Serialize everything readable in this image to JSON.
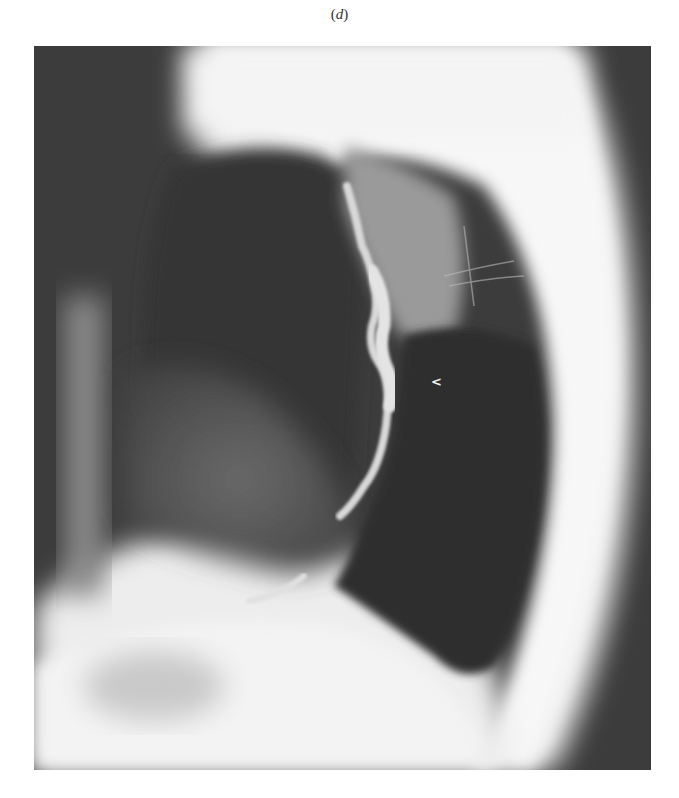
{
  "figure": {
    "panel_label_open": "(",
    "panel_label_letter": "d",
    "panel_label_close": ")",
    "image_type": "radiograph",
    "annotation_marker": "<",
    "colors": {
      "background": "#ffffff",
      "dark_field": "#3a3a3a",
      "bright_field": "#f2f2f2"
    }
  }
}
